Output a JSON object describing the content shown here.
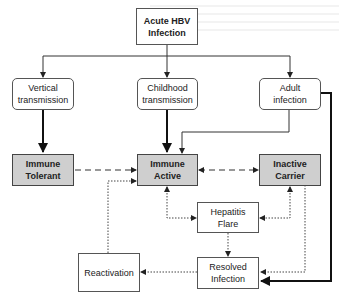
{
  "diagram": {
    "nodes": {
      "acute": {
        "label": "Acute HBV\nInfection"
      },
      "vertical": {
        "label": "Vertical\ntransmission"
      },
      "childhood": {
        "label": "Childhood\ntransmission"
      },
      "adult": {
        "label": "Adult\ninfection"
      },
      "tolerant": {
        "label": "Immune\nTolerant"
      },
      "active": {
        "label": "Immune\nActive"
      },
      "inactive": {
        "label": "Inactive\nCarrier"
      },
      "flare": {
        "label": "Hepatitis\nFlare"
      },
      "reactivation": {
        "label": "Reactivation"
      },
      "resolved": {
        "label": "Resolved\nInfection"
      }
    },
    "edges": [
      {
        "from": "Acute HBV Infection",
        "to": "Vertical transmission",
        "style": "solid"
      },
      {
        "from": "Acute HBV Infection",
        "to": "Childhood transmission",
        "style": "solid"
      },
      {
        "from": "Acute HBV Infection",
        "to": "Adult infection",
        "style": "solid"
      },
      {
        "from": "Vertical transmission",
        "to": "Immune Tolerant",
        "style": "thick"
      },
      {
        "from": "Childhood transmission",
        "to": "Immune Active",
        "style": "thick"
      },
      {
        "from": "Adult infection",
        "to": "Immune Active",
        "style": "solid"
      },
      {
        "from": "Adult infection",
        "to": "Resolved Infection",
        "style": "thick"
      },
      {
        "from": "Immune Tolerant",
        "to": "Immune Active",
        "style": "dashed"
      },
      {
        "from": "Immune Active",
        "to": "Inactive Carrier",
        "style": "dashed-bidirectional"
      },
      {
        "from": "Immune Active",
        "to": "Hepatitis Flare",
        "style": "dotted-bidirectional"
      },
      {
        "from": "Inactive Carrier",
        "to": "Hepatitis Flare",
        "style": "dotted-bidirectional"
      },
      {
        "from": "Hepatitis Flare",
        "to": "Resolved Infection",
        "style": "dotted"
      },
      {
        "from": "Inactive Carrier",
        "to": "Resolved Infection",
        "style": "dotted"
      },
      {
        "from": "Resolved Infection",
        "to": "Reactivation",
        "style": "dotted"
      },
      {
        "from": "Reactivation",
        "to": "Immune Active",
        "style": "dotted"
      }
    ],
    "colors": {
      "phase_fill": "#cfcfcf",
      "line": "#333333",
      "box_border": "#555555"
    }
  }
}
